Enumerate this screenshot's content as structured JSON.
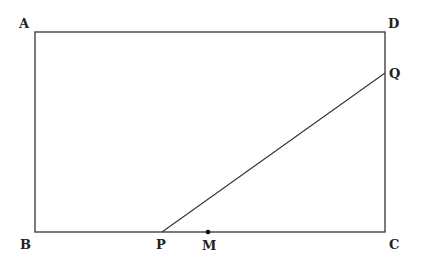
{
  "diagram": {
    "type": "geometry",
    "rectangle": {
      "vertices": [
        "A",
        "B",
        "C",
        "D"
      ]
    },
    "points": {
      "A": {
        "label": "A",
        "x": 35,
        "y": 32
      },
      "B": {
        "label": "B",
        "x": 35,
        "y": 232
      },
      "C": {
        "label": "C",
        "x": 385,
        "y": 232
      },
      "D": {
        "label": "D",
        "x": 385,
        "y": 32
      },
      "P": {
        "label": "P",
        "x": 162,
        "y": 232
      },
      "M": {
        "label": "M",
        "x": 208,
        "y": 232
      },
      "Q": {
        "label": "Q",
        "x": 385,
        "y": 73
      }
    },
    "segments": [
      [
        "A",
        "D"
      ],
      [
        "D",
        "C"
      ],
      [
        "C",
        "B"
      ],
      [
        "B",
        "A"
      ],
      [
        "P",
        "Q"
      ]
    ],
    "marked_points": [
      "M"
    ]
  }
}
